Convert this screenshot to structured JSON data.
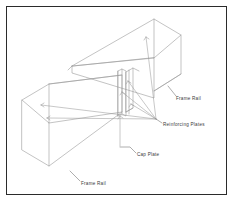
{
  "figure": {
    "border_color": "#2b2b2b",
    "line_color": "#9a9a9a",
    "text_color": "#3a3a3a",
    "background_color": "#ffffff"
  },
  "callouts": [
    {
      "id": "frame-rail-upper",
      "label": "Frame Rail",
      "text_x": 176,
      "text_y": 99,
      "leader": "M 176 96 L 168 87"
    },
    {
      "id": "reinforcing-plates",
      "label": "Reinforcing Plates",
      "text_x": 163,
      "text_y": 125,
      "leader": "M 162 123 L 156 119"
    },
    {
      "id": "cap-plate",
      "label": "Cap Plate",
      "text_x": 137,
      "text_y": 155,
      "leader": "M 136 153 L 131 148 L 131 143"
    },
    {
      "id": "frame-rail-lower",
      "label": "Frame Rail",
      "text_x": 81,
      "text_y": 184,
      "leader": "M 80 181 L 71 172"
    }
  ]
}
